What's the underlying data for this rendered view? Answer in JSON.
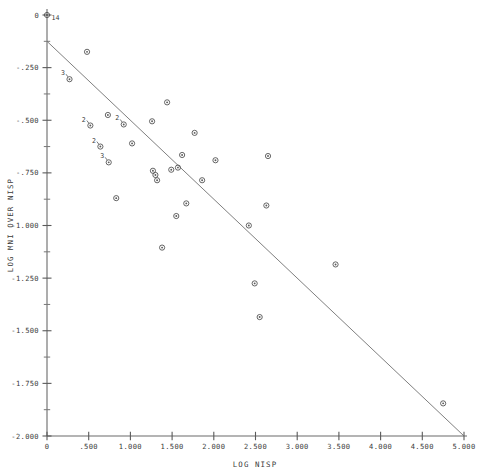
{
  "chart_data": {
    "type": "scatter",
    "title": "",
    "xlabel": "LOG NISP",
    "ylabel": "LOG MNI OVER NISP",
    "xlim": [
      0,
      5.0
    ],
    "ylim": [
      -2.0,
      0.0
    ],
    "grid": false,
    "legend": null,
    "x_ticks": [
      {
        "value": 0,
        "label": "0"
      },
      {
        "value": 0.5,
        "label": ".500"
      },
      {
        "value": 1.0,
        "label": "1.000"
      },
      {
        "value": 1.5,
        "label": "1.500"
      },
      {
        "value": 2.0,
        "label": "2.000"
      },
      {
        "value": 2.5,
        "label": "2.500"
      },
      {
        "value": 3.0,
        "label": "3.000"
      },
      {
        "value": 3.5,
        "label": "3.500"
      },
      {
        "value": 4.0,
        "label": "4.000"
      },
      {
        "value": 4.5,
        "label": "4.500"
      },
      {
        "value": 5.0,
        "label": "5.000"
      }
    ],
    "y_ticks": [
      {
        "value": 0.0,
        "label": "0"
      },
      {
        "value": -0.25,
        "label": "-.250"
      },
      {
        "value": -0.5,
        "label": "-.500"
      },
      {
        "value": -0.75,
        "label": "-.750"
      },
      {
        "value": -1.0,
        "label": "-1.000"
      },
      {
        "value": -1.25,
        "label": "-1.250"
      },
      {
        "value": -1.5,
        "label": "-1.500"
      },
      {
        "value": -1.75,
        "label": "-1.750"
      },
      {
        "value": -2.0,
        "label": "-2.000"
      }
    ],
    "y_minor_ticks": [
      -0.125,
      -0.375,
      -0.625,
      -0.875,
      -1.125,
      -1.375,
      -1.625,
      -1.875
    ],
    "fit_line": {
      "label": "regression-line",
      "x1": 0.0,
      "y1": -0.125,
      "x2": 5.0,
      "y2": -2.0
    },
    "points": [
      {
        "x": 0.0,
        "y": 0.0,
        "count": "14"
      },
      {
        "x": 0.48,
        "y": -0.175,
        "count": ""
      },
      {
        "x": 0.27,
        "y": -0.305,
        "count": "3"
      },
      {
        "x": 0.73,
        "y": -0.475,
        "count": ""
      },
      {
        "x": 0.52,
        "y": -0.525,
        "count": "2"
      },
      {
        "x": 0.92,
        "y": -0.52,
        "count": "2"
      },
      {
        "x": 1.26,
        "y": -0.505,
        "count": ""
      },
      {
        "x": 1.44,
        "y": -0.415,
        "count": ""
      },
      {
        "x": 0.64,
        "y": -0.625,
        "count": "2"
      },
      {
        "x": 1.02,
        "y": -0.61,
        "count": ""
      },
      {
        "x": 1.77,
        "y": -0.56,
        "count": ""
      },
      {
        "x": 0.74,
        "y": -0.7,
        "count": "3"
      },
      {
        "x": 1.62,
        "y": -0.665,
        "count": ""
      },
      {
        "x": 2.02,
        "y": -0.69,
        "count": ""
      },
      {
        "x": 2.65,
        "y": -0.67,
        "count": ""
      },
      {
        "x": 1.27,
        "y": -0.74,
        "count": ""
      },
      {
        "x": 1.3,
        "y": -0.76,
        "count": ""
      },
      {
        "x": 1.32,
        "y": -0.785,
        "count": ""
      },
      {
        "x": 1.49,
        "y": -0.735,
        "count": ""
      },
      {
        "x": 1.57,
        "y": -0.725,
        "count": ""
      },
      {
        "x": 1.86,
        "y": -0.785,
        "count": ""
      },
      {
        "x": 0.83,
        "y": -0.87,
        "count": ""
      },
      {
        "x": 1.67,
        "y": -0.895,
        "count": ""
      },
      {
        "x": 2.63,
        "y": -0.905,
        "count": ""
      },
      {
        "x": 1.55,
        "y": -0.955,
        "count": ""
      },
      {
        "x": 2.42,
        "y": -1.0,
        "count": ""
      },
      {
        "x": 1.38,
        "y": -1.105,
        "count": ""
      },
      {
        "x": 3.46,
        "y": -1.185,
        "count": ""
      },
      {
        "x": 2.49,
        "y": -1.275,
        "count": ""
      },
      {
        "x": 2.55,
        "y": -1.435,
        "count": ""
      },
      {
        "x": 4.75,
        "y": -1.845,
        "count": ""
      }
    ]
  },
  "axis_titles": {
    "x": "LOG NISP",
    "y": "LOG MNI OVER NISP"
  }
}
